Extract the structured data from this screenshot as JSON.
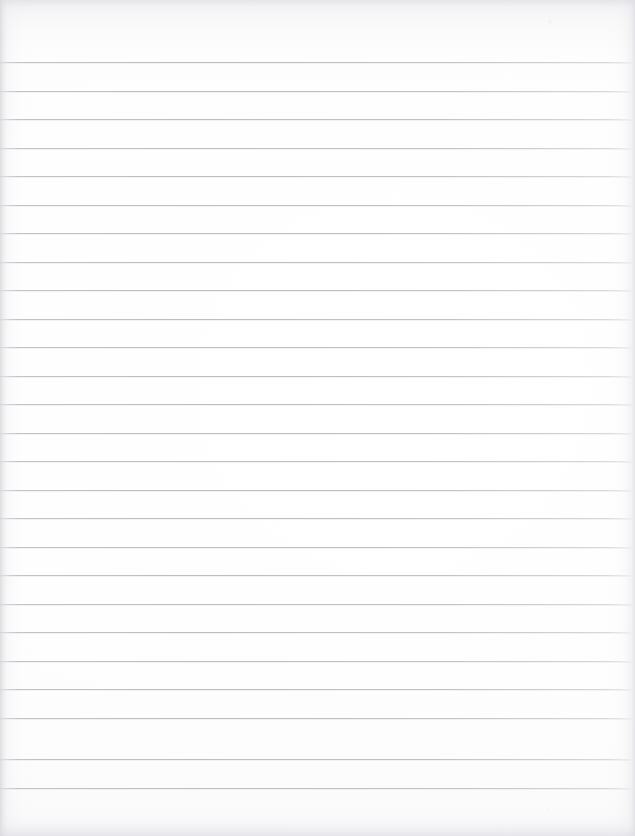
{
  "document": {
    "type": "scanned-ruled-paper",
    "title": "Blank ruled notebook paper",
    "page_width": 635,
    "page_height": 836,
    "has_text_content": false,
    "visible_text": "",
    "orientation": "portrait"
  },
  "paper": {
    "background_color": "#fdfdfd",
    "tint_color": "#f7f7f9",
    "edge_shadow_color": "#cdcdd4"
  },
  "rules": {
    "line_color": "#bcbdc6",
    "line_thickness_px": 1,
    "first_line_y": 62,
    "spacing_px": 28.5,
    "count": 26,
    "left_x": 0,
    "right_x": 631,
    "y_positions": [
      62,
      90.5,
      119,
      147.5,
      176,
      204.5,
      233,
      261.5,
      290,
      318.5,
      347,
      375.5,
      404,
      432.5,
      461,
      489.5,
      518,
      546.5,
      575,
      603.5,
      632,
      660.5,
      689,
      717.5,
      759,
      787.5
    ]
  },
  "margins": {
    "top_margin_px": 62,
    "bottom_margin_px": 48,
    "left_margin_px": 0,
    "right_margin_px": 4
  },
  "specks": [
    {
      "x": 548,
      "y": 19,
      "w": 4,
      "h": 5,
      "opacity": 0.38
    },
    {
      "x": 554,
      "y": 26,
      "w": 2,
      "h": 2,
      "opacity": 0.3
    },
    {
      "x": 104,
      "y": 452,
      "w": 2,
      "h": 2,
      "opacity": 0.26
    },
    {
      "x": 276,
      "y": 525,
      "w": 2,
      "h": 2,
      "opacity": 0.24
    },
    {
      "x": 509,
      "y": 471,
      "w": 2,
      "h": 2,
      "opacity": 0.22
    },
    {
      "x": 546,
      "y": 808,
      "w": 3,
      "h": 3,
      "opacity": 0.26
    },
    {
      "x": 120,
      "y": 746,
      "w": 2,
      "h": 2,
      "opacity": 0.22
    }
  ]
}
